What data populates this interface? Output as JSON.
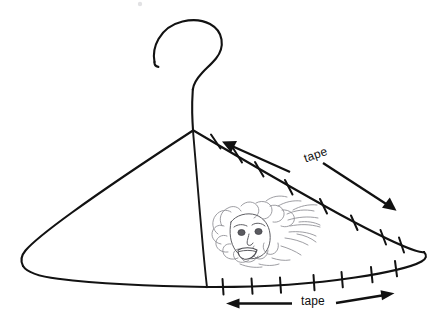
{
  "figure": {
    "background_color": "#ffffff",
    "ink_color": "#121212",
    "scribble_color": "#8d8d92",
    "width": 442,
    "height": 327
  },
  "labels": {
    "tape_upper": "tape",
    "tape_lower": "tape"
  },
  "annotations": {
    "upper_edge": {
      "name": "right-shoulder-edge",
      "tape_marks": 8,
      "arrow_left_direction": "up-left",
      "arrow_right_direction": "down-right"
    },
    "bottom_edge": {
      "name": "bottom-bar-edge",
      "tape_marks": 7,
      "arrow_left_direction": "left",
      "arrow_right_direction": "right"
    }
  },
  "parts": {
    "hook": "hanger-hook",
    "neck": "hanger-neck",
    "left_shoulder": "left-shoulder-wire",
    "right_shoulder": "right-shoulder-wire",
    "bottom_bar": "bottom-bar-wire",
    "center_strut": "center-vertical-wire",
    "face_doodle": "scribbled-face-doodle"
  }
}
